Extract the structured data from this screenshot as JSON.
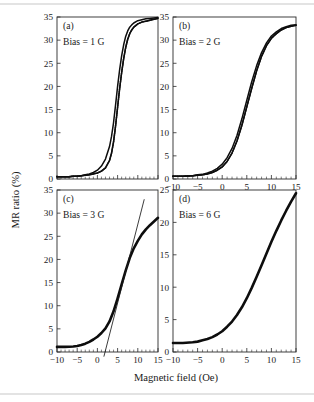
{
  "figure": {
    "xlabel": "Magnetic field (Oe)",
    "ylabel": "MR ratio (%)"
  },
  "chart_data": [
    {
      "type": "line",
      "panel": "(a)",
      "annotation": "Bias = 1 G",
      "title": "",
      "xlabel": "",
      "ylabel": "MR ratio (%)",
      "xlim": [
        -10,
        15
      ],
      "ylim": [
        0,
        35
      ],
      "xticks": [
        -10,
        -5,
        0,
        5,
        10,
        15
      ],
      "xticklabels": [
        "",
        "",
        "",
        "",
        "",
        ""
      ],
      "yticks": [
        0,
        5,
        10,
        15,
        20,
        25,
        30,
        35
      ],
      "yticklabels": [
        "0",
        "5",
        "10",
        "15",
        "20",
        "25",
        "30",
        "35"
      ],
      "grid": false,
      "legend": "none",
      "series": [
        {
          "name": "sweep-up",
          "x": [
            -10,
            -9,
            -8,
            -7,
            -6,
            -5,
            -4,
            -3,
            -2,
            -1,
            0,
            1,
            2,
            3,
            3.5,
            4,
            4.5,
            5,
            5.5,
            6,
            6.5,
            7,
            7.5,
            8,
            8.5,
            9,
            10,
            11,
            12,
            13,
            14,
            15
          ],
          "y": [
            0.5,
            0.5,
            0.5,
            0.5,
            0.6,
            0.6,
            0.7,
            0.8,
            0.9,
            1.1,
            1.3,
            1.7,
            2.4,
            4.0,
            5.6,
            8.0,
            11.5,
            15.5,
            19.5,
            23.0,
            26.0,
            28.4,
            30.2,
            31.4,
            32.2,
            32.8,
            33.5,
            33.9,
            34.1,
            34.3,
            34.5,
            34.7
          ]
        },
        {
          "name": "sweep-down",
          "x": [
            -10,
            -9,
            -8,
            -7,
            -6,
            -5,
            -4,
            -3,
            -2,
            -1,
            0,
            1,
            2,
            3,
            3.5,
            4,
            4.5,
            5,
            5.5,
            6,
            6.5,
            7,
            7.5,
            8,
            8.5,
            9,
            10,
            11,
            12,
            13,
            14,
            15
          ],
          "y": [
            0.5,
            0.5,
            0.5,
            0.5,
            0.6,
            0.6,
            0.7,
            0.9,
            1.1,
            1.4,
            1.9,
            2.8,
            4.3,
            7.0,
            9.2,
            12.2,
            16.0,
            20.0,
            23.6,
            26.6,
            29.0,
            30.8,
            32.0,
            32.8,
            33.3,
            33.7,
            34.2,
            34.4,
            34.6,
            34.7,
            34.8,
            34.9
          ]
        }
      ]
    },
    {
      "type": "line",
      "panel": "(b)",
      "annotation": "Bias = 2 G",
      "title": "",
      "xlabel": "",
      "ylabel": "",
      "xlim": [
        -10,
        15
      ],
      "ylim": [
        0,
        35
      ],
      "xticks": [
        -10,
        -5,
        0,
        5,
        10,
        15
      ],
      "xticklabels": [
        "-10",
        "-5",
        "0",
        "5",
        "10",
        "15"
      ],
      "yticks": [
        0,
        5,
        10,
        15,
        20,
        25,
        30,
        35
      ],
      "yticklabels": [
        "0",
        "5",
        "10",
        "15",
        "20",
        "25",
        "30",
        "35"
      ],
      "grid": false,
      "legend": "none",
      "series": [
        {
          "name": "sweep-up",
          "x": [
            -10,
            -8,
            -6,
            -5,
            -4,
            -3,
            -2,
            -1,
            0,
            1,
            2,
            3,
            4,
            5,
            6,
            7,
            8,
            9,
            10,
            11,
            12,
            13,
            14,
            15
          ],
          "y": [
            0.6,
            0.6,
            0.7,
            0.8,
            0.9,
            1.1,
            1.4,
            1.9,
            2.6,
            3.8,
            5.6,
            8.2,
            11.6,
            15.6,
            19.6,
            23.4,
            26.5,
            28.8,
            30.4,
            31.4,
            32.2,
            32.7,
            33.0,
            33.2
          ]
        },
        {
          "name": "sweep-down",
          "x": [
            -10,
            -8,
            -6,
            -5,
            -4,
            -3,
            -2,
            -1,
            0,
            1,
            2,
            3,
            4,
            5,
            6,
            7,
            8,
            9,
            10,
            11,
            12,
            13,
            14,
            15
          ],
          "y": [
            0.6,
            0.6,
            0.7,
            0.9,
            1.0,
            1.3,
            1.7,
            2.3,
            3.2,
            4.6,
            6.6,
            9.4,
            13.0,
            17.0,
            21.0,
            24.5,
            27.3,
            29.4,
            30.9,
            31.8,
            32.5,
            32.9,
            33.2,
            33.3
          ]
        }
      ]
    },
    {
      "type": "line",
      "panel": "(c)",
      "annotation": "Bias = 3 G",
      "title": "",
      "xlabel": "Magnetic field (Oe)",
      "ylabel": "MR ratio (%)",
      "xlim": [
        -10,
        15
      ],
      "ylim": [
        0,
        35
      ],
      "xticks": [
        -10,
        -5,
        0,
        5,
        10,
        15
      ],
      "xticklabels": [
        "-10",
        "-5",
        "0",
        "5",
        "10",
        "15"
      ],
      "yticks": [
        0,
        5,
        10,
        15,
        20,
        25,
        30,
        35
      ],
      "yticklabels": [
        "0",
        "5",
        "10",
        "15",
        "20",
        "25",
        "30",
        "35"
      ],
      "grid": false,
      "legend": "none",
      "has_tangent_line": true,
      "tangent_line": {
        "x": [
          1.6,
          11.6
        ],
        "y": [
          -1.0,
          33.0
        ]
      },
      "series": [
        {
          "name": "sweep",
          "x": [
            -10,
            -8,
            -6,
            -5,
            -4,
            -3,
            -2,
            -1,
            0,
            1,
            2,
            3,
            4,
            5,
            6,
            7,
            8,
            9,
            10,
            11,
            12,
            13,
            14,
            15
          ],
          "y": [
            1.1,
            1.1,
            1.2,
            1.3,
            1.5,
            1.8,
            2.2,
            2.7,
            3.3,
            4.1,
            5.1,
            6.6,
            8.8,
            11.6,
            14.6,
            17.6,
            20.3,
            22.4,
            24.0,
            25.4,
            26.5,
            27.4,
            28.2,
            29.0
          ]
        }
      ]
    },
    {
      "type": "line",
      "panel": "(d)",
      "annotation": "Bias = 6 G",
      "title": "",
      "xlabel": "Magnetic field (Oe)",
      "ylabel": "",
      "xlim": [
        -10,
        15
      ],
      "ylim": [
        0,
        25
      ],
      "xticks": [
        -10,
        -5,
        0,
        5,
        10,
        15
      ],
      "xticklabels": [
        "-10",
        "-5",
        "0",
        "5",
        "10",
        "15"
      ],
      "yticks": [
        0,
        5,
        10,
        15,
        20,
        25
      ],
      "yticklabels": [
        "0",
        "5",
        "10",
        "15",
        "20",
        "25"
      ],
      "grid": false,
      "legend": "none",
      "series": [
        {
          "name": "sweep",
          "x": [
            -10,
            -8,
            -6,
            -5,
            -4,
            -3,
            -2,
            -1,
            0,
            1,
            2,
            3,
            4,
            5,
            6,
            7,
            8,
            9,
            10,
            11,
            12,
            13,
            14,
            15
          ],
          "y": [
            1.4,
            1.4,
            1.5,
            1.6,
            1.8,
            2.0,
            2.3,
            2.7,
            3.2,
            3.9,
            4.7,
            5.7,
            6.9,
            8.3,
            9.9,
            11.6,
            13.4,
            15.2,
            17.0,
            18.7,
            20.3,
            21.8,
            23.2,
            24.5
          ]
        }
      ]
    }
  ]
}
